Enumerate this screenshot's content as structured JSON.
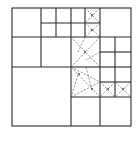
{
  "diagram": {
    "type": "quadtree-mesh",
    "colors": {
      "line": "#2a2a2a",
      "dashed": "#555555",
      "background": "#ffffff"
    },
    "outer": {
      "x1": 12,
      "y1": 8,
      "x2": 131,
      "y2": 126
    },
    "solid_lines": [
      [
        12,
        37,
        131,
        37
      ],
      [
        12,
        67,
        71,
        67
      ],
      [
        41,
        8,
        41,
        67
      ],
      [
        41,
        23,
        100,
        23
      ],
      [
        56,
        8,
        56,
        37
      ],
      [
        71,
        8,
        71,
        126
      ],
      [
        85,
        8,
        85,
        37
      ],
      [
        100,
        8,
        100,
        126
      ],
      [
        12,
        67,
        12,
        67
      ],
      [
        71,
        67,
        100,
        67
      ],
      [
        100,
        52,
        131,
        52
      ],
      [
        100,
        67,
        131,
        67
      ],
      [
        100,
        82,
        131,
        82
      ],
      [
        115,
        37,
        115,
        97
      ],
      [
        71,
        97,
        131,
        97
      ]
    ],
    "dashed_lines": [
      [
        85,
        8,
        100,
        23
      ],
      [
        100,
        8,
        85,
        23
      ],
      [
        85,
        23,
        100,
        37
      ],
      [
        100,
        23,
        85,
        37
      ],
      [
        71,
        37,
        100,
        67
      ],
      [
        100,
        37,
        71,
        67
      ],
      [
        85,
        37,
        78,
        52
      ],
      [
        100,
        52,
        86,
        60
      ],
      [
        71,
        67,
        100,
        82
      ],
      [
        71,
        67,
        100,
        97
      ],
      [
        78,
        75,
        71,
        97
      ],
      [
        71,
        97,
        100,
        82
      ],
      [
        86,
        67,
        92,
        90
      ],
      [
        100,
        82,
        115,
        97
      ],
      [
        115,
        82,
        100,
        97
      ],
      [
        115,
        82,
        131,
        97
      ],
      [
        131,
        82,
        115,
        97
      ]
    ],
    "nodes": [
      [
        92,
        15
      ],
      [
        92,
        30
      ],
      [
        85,
        52
      ],
      [
        79,
        74
      ],
      [
        92,
        89
      ],
      [
        108,
        89
      ],
      [
        123,
        89
      ]
    ]
  }
}
